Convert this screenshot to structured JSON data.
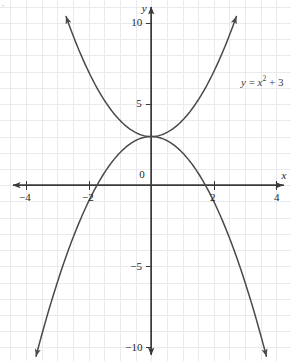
{
  "figure": {
    "name": "graph-two-parabolas",
    "background_color": "#ffffff",
    "grid_color": "#e9e9ee",
    "axis_color": "#3a3a3a",
    "curve_color": "#4a4a4a",
    "label_color": "#231f20",
    "equation_color": "#3c3c3c"
  },
  "axes": {
    "x_label": "x",
    "y_label": "y",
    "x_ticks": [
      {
        "value": -4,
        "label": "−4",
        "px": 25
      },
      {
        "value": -2,
        "label": "−2",
        "px": 88
      },
      {
        "value": 2,
        "label": "2",
        "px": 213
      },
      {
        "value": 4,
        "label": "4",
        "px": 277
      }
    ],
    "y_ticks": [
      {
        "value": 10,
        "label": "10",
        "px": 22
      },
      {
        "value": 5,
        "label": "5",
        "px": 103
      },
      {
        "value": -5,
        "label": "−5",
        "px": 266
      },
      {
        "value": -10,
        "label": "−10",
        "px": 347
      }
    ],
    "origin_label": "0",
    "x_range": [
      -4.4,
      4.4
    ],
    "y_range": [
      -11.0,
      10.8
    ],
    "grid_step_x": 0.5,
    "grid_step_y": 1
  },
  "annotations": [
    {
      "name": "equation-label",
      "text_parts": {
        "lhs": "y",
        "eq": " = ",
        "base": "x",
        "exp": "2",
        "tail": " + 3"
      },
      "plain": "y = x² + 3",
      "x_px": 241,
      "y_px": 74
    }
  ],
  "chart_data": {
    "type": "line",
    "title": "",
    "xlabel": "x",
    "ylabel": "y",
    "xlim": [
      -4.4,
      4.4
    ],
    "ylim": [
      -11.0,
      10.8
    ],
    "grid": true,
    "legend": "none",
    "annotations": [
      "y = x² + 3"
    ],
    "series": [
      {
        "name": "y = x^2 + 3",
        "equation": "y = x^2 + 3",
        "vertex": [
          0,
          3
        ],
        "opens": "up",
        "arrow_ends": [
          "top-left",
          "top-right"
        ],
        "points": [
          {
            "x": -2.75,
            "y": 10.5625
          },
          {
            "x": -2.5,
            "y": 9.25
          },
          {
            "x": -2.0,
            "y": 7.0
          },
          {
            "x": -1.5,
            "y": 5.25
          },
          {
            "x": -1.0,
            "y": 4.0
          },
          {
            "x": -0.5,
            "y": 3.25
          },
          {
            "x": 0.0,
            "y": 3.0
          },
          {
            "x": 0.5,
            "y": 3.25
          },
          {
            "x": 1.0,
            "y": 4.0
          },
          {
            "x": 1.5,
            "y": 5.25
          },
          {
            "x": 2.0,
            "y": 7.0
          },
          {
            "x": 2.5,
            "y": 9.25
          },
          {
            "x": 2.75,
            "y": 10.5625
          }
        ]
      },
      {
        "name": "y = -x^2 + 3",
        "equation": "y = -x^2 + 3",
        "vertex": [
          0,
          3
        ],
        "opens": "down",
        "arrow_ends": [
          "top-left",
          "bottom-left",
          "bottom-right"
        ],
        "x_intercepts": [
          -1.732,
          1.732
        ],
        "points": [
          {
            "x": -3.7,
            "y": -10.69
          },
          {
            "x": -3.5,
            "y": -9.25
          },
          {
            "x": -3.0,
            "y": -6.0
          },
          {
            "x": -2.5,
            "y": -3.25
          },
          {
            "x": -2.0,
            "y": -1.0
          },
          {
            "x": -1.5,
            "y": 0.75
          },
          {
            "x": -1.0,
            "y": 2.0
          },
          {
            "x": -0.5,
            "y": 2.75
          },
          {
            "x": 0.0,
            "y": 3.0
          },
          {
            "x": 0.5,
            "y": 2.75
          },
          {
            "x": 1.0,
            "y": 2.0
          },
          {
            "x": 1.5,
            "y": 0.75
          },
          {
            "x": 2.0,
            "y": -1.0
          },
          {
            "x": 2.5,
            "y": -3.25
          },
          {
            "x": 3.0,
            "y": -6.0
          },
          {
            "x": 3.5,
            "y": -9.25
          },
          {
            "x": 3.7,
            "y": -10.69
          }
        ]
      }
    ]
  }
}
